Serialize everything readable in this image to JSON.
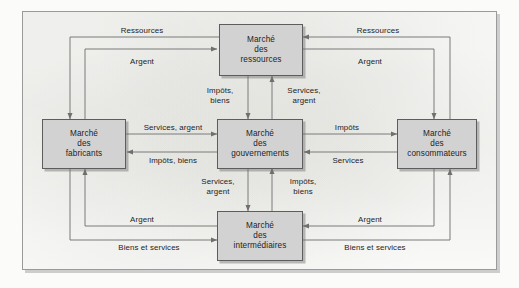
{
  "diagram": {
    "nodes": [
      {
        "id": "ressources",
        "lines": [
          "Marché",
          "des",
          "ressources"
        ]
      },
      {
        "id": "fabricants",
        "lines": [
          "Marché",
          "des",
          "fabricants"
        ]
      },
      {
        "id": "gouvernements",
        "lines": [
          "Marché",
          "des",
          "gouvernements"
        ]
      },
      {
        "id": "consommateurs",
        "lines": [
          "Marché",
          "des",
          "consommateurs"
        ]
      },
      {
        "id": "intermediaires",
        "lines": [
          "Marché",
          "des",
          "intermédiaires"
        ]
      }
    ],
    "edges": [
      {
        "id": "ressources-to-fabricants",
        "label": "Ressources",
        "from": "ressources",
        "to": "fabricants"
      },
      {
        "id": "fabricants-to-ressources",
        "label": "Argent",
        "from": "fabricants",
        "to": "ressources"
      },
      {
        "id": "consommateurs-to-ressources",
        "label": "Ressources",
        "from": "consommateurs",
        "to": "ressources"
      },
      {
        "id": "ressources-to-consommateurs",
        "label": "Argent",
        "from": "ressources",
        "to": "consommateurs"
      },
      {
        "id": "ressources-to-gouvernements",
        "label": "Impôts,\nbiens",
        "label_l1": "Impôts,",
        "label_l2": "biens",
        "from": "ressources",
        "to": "gouvernements"
      },
      {
        "id": "gouvernements-to-ressources",
        "label": "Services,\nargent",
        "label_l1": "Services,",
        "label_l2": "argent",
        "from": "gouvernements",
        "to": "ressources"
      },
      {
        "id": "fabricants-to-gouvernements",
        "label": "Services, argent",
        "from": "fabricants",
        "to": "gouvernements"
      },
      {
        "id": "gouvernements-to-fabricants",
        "label": "Impôts, biens",
        "from": "gouvernements",
        "to": "fabricants"
      },
      {
        "id": "gouvernements-to-consommateurs",
        "label": "Impôts",
        "from": "gouvernements",
        "to": "consommateurs"
      },
      {
        "id": "consommateurs-to-gouvernements",
        "label": "Services",
        "from": "consommateurs",
        "to": "gouvernements"
      },
      {
        "id": "gouvernements-to-intermediaires",
        "label": "Services,\nargent",
        "label_l1": "Services,",
        "label_l2": "argent",
        "from": "gouvernements",
        "to": "intermediaires"
      },
      {
        "id": "intermediaires-to-gouvernements",
        "label": "Impôts,\nbiens",
        "label_l1": "Impôts,",
        "label_l2": "biens",
        "from": "intermediaires",
        "to": "gouvernements"
      },
      {
        "id": "intermediaires-to-fabricants",
        "label": "Argent",
        "from": "intermediaires",
        "to": "fabricants"
      },
      {
        "id": "fabricants-to-intermediaires",
        "label": "Biens et services",
        "from": "fabricants",
        "to": "intermediaires"
      },
      {
        "id": "consommateurs-to-intermediaires",
        "label": "Argent",
        "from": "consommateurs",
        "to": "intermediaires"
      },
      {
        "id": "intermediaires-to-consommateurs",
        "label": "Biens et services",
        "from": "intermediaires",
        "to": "consommateurs"
      }
    ],
    "colors": {
      "node_fill": "#d2d2d2",
      "node_border": "#5d5d5d",
      "line": "#7a7a7a",
      "frame": "#9a9a9a",
      "page": "#fcfcfb",
      "text": "#1d1d1d"
    }
  }
}
